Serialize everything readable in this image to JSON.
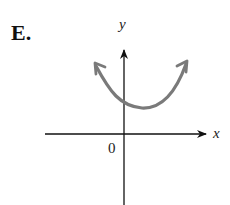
{
  "figure": {
    "option_label": "E.",
    "x_axis_label": "x",
    "y_axis_label": "y",
    "origin_label": "0"
  },
  "colors": {
    "axes": "#111111",
    "curve": "#7a7a7a",
    "text": "#111111"
  },
  "curve": {
    "type": "parabola",
    "opens": "up",
    "vertex_position": "right of y-axis, above x-axis",
    "y_intercept": "positive",
    "ends": "arrows at both ends"
  }
}
